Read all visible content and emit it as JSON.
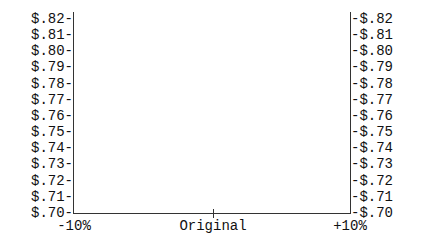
{
  "chart_data": {
    "type": "line",
    "title": "",
    "xlabel": "",
    "ylabel": "",
    "categories": [
      "-10%",
      "Original",
      "+10%"
    ],
    "x_tick_labels": [
      "-10%",
      "Original",
      "+10%"
    ],
    "y_tick_labels_left": [
      "$.82-",
      "$.81-",
      "$.80-",
      "$.79-",
      "$.78-",
      "$.77-",
      "$.76-",
      "$.75-",
      "$.74-",
      "$.73-",
      "$.72-",
      "$.71-",
      "$.70-"
    ],
    "y_tick_labels_right": [
      "-$.82",
      "-$.81",
      "-$.80",
      "-$.79",
      "-$.78",
      "-$.77",
      "-$.76",
      "-$.75",
      "-$.74",
      "-$.73",
      "-$.72",
      "-$.71",
      "-$.70"
    ],
    "y_ticks": [
      0.82,
      0.81,
      0.8,
      0.79,
      0.78,
      0.77,
      0.76,
      0.75,
      0.74,
      0.73,
      0.72,
      0.71,
      0.7
    ],
    "ylim": [
      0.7,
      0.82
    ],
    "series": [],
    "grid": false,
    "legend": null,
    "center_marker": "+"
  },
  "axis_color": "#333333"
}
